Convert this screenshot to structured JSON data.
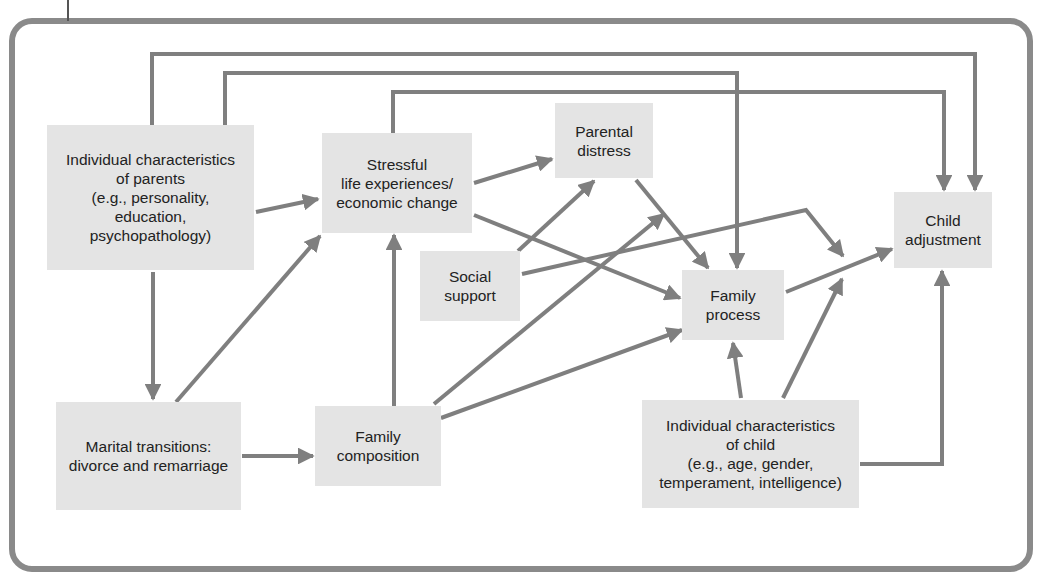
{
  "diagram": {
    "colors": {
      "frame": "#8a8a8a",
      "edge": "#7f7f7f",
      "node_fill": "#e4e4e4",
      "text": "#222222",
      "background": "#ffffff"
    },
    "nodes": [
      {
        "id": "parents",
        "label": "Individual characteristics\nof parents\n(e.g., personality,\neducation,\npsychopathology)",
        "x": 47,
        "y": 125,
        "w": 207,
        "h": 145
      },
      {
        "id": "stressful",
        "label": "Stressful\nlife experiences/\neconomic change",
        "x": 322,
        "y": 133,
        "w": 150,
        "h": 100
      },
      {
        "id": "parental_distress",
        "label": "Parental\ndistress",
        "x": 555,
        "y": 103,
        "w": 98,
        "h": 75
      },
      {
        "id": "social_support",
        "label": "Social\nsupport",
        "x": 420,
        "y": 251,
        "w": 100,
        "h": 70
      },
      {
        "id": "family_process",
        "label": "Family\nprocess",
        "x": 682,
        "y": 270,
        "w": 102,
        "h": 70
      },
      {
        "id": "child_adjustment",
        "label": "Child\nadjustment",
        "x": 894,
        "y": 192,
        "w": 98,
        "h": 76
      },
      {
        "id": "marital",
        "label": "Marital transitions:\ndivorce and remarriage",
        "x": 56,
        "y": 402,
        "w": 185,
        "h": 108
      },
      {
        "id": "family_composition",
        "label": "Family\ncomposition",
        "x": 315,
        "y": 406,
        "w": 126,
        "h": 80
      },
      {
        "id": "child_chars",
        "label": "Individual characteristics\nof child\n(e.g., age, gender,\ntemperament, intelligence)",
        "x": 642,
        "y": 400,
        "w": 217,
        "h": 108
      }
    ],
    "edges": [
      {
        "from": "parents",
        "to": "child_adjustment",
        "points": [
          [
            152,
            125
          ],
          [
            152,
            54
          ],
          [
            975,
            54
          ],
          [
            975,
            190
          ]
        ],
        "arrow": true
      },
      {
        "from": "parents",
        "to": "family_process",
        "points": [
          [
            225,
            125
          ],
          [
            225,
            73
          ],
          [
            737,
            73
          ],
          [
            737,
            268
          ]
        ],
        "arrow": true
      },
      {
        "from": "stressful",
        "to": "child_adjustment",
        "points": [
          [
            393,
            133
          ],
          [
            393,
            92
          ],
          [
            944,
            92
          ],
          [
            944,
            190
          ]
        ],
        "arrow": true
      },
      {
        "from": "parents",
        "to": "stressful",
        "points": [
          [
            256,
            212
          ],
          [
            318,
            199
          ]
        ],
        "arrow": true
      },
      {
        "from": "parents",
        "to": "marital",
        "points": [
          [
            153,
            272
          ],
          [
            153,
            399
          ]
        ],
        "arrow": true
      },
      {
        "from": "marital",
        "to": "stressful",
        "points": [
          [
            176,
            402
          ],
          [
            320,
            236
          ]
        ],
        "arrow": true
      },
      {
        "from": "marital",
        "to": "family_composition",
        "points": [
          [
            242,
            456
          ],
          [
            313,
            456
          ]
        ],
        "arrow": true
      },
      {
        "from": "family_composition",
        "to": "stressful",
        "points": [
          [
            394,
            406
          ],
          [
            394,
            235
          ]
        ],
        "arrow": true
      },
      {
        "from": "stressful",
        "to": "parental_distress",
        "points": [
          [
            474,
            183
          ],
          [
            552,
            159
          ]
        ],
        "arrow": true
      },
      {
        "from": "stressful",
        "to": "family_process",
        "points": [
          [
            474,
            215
          ],
          [
            680,
            298
          ]
        ],
        "arrow": true
      },
      {
        "from": "social_support",
        "to": "parental_distress",
        "points": [
          [
            518,
            251
          ],
          [
            594,
            181
          ]
        ],
        "arrow": true
      },
      {
        "from": "social_support",
        "to": "child_adjustment_path",
        "points": [
          [
            522,
            274
          ],
          [
            806,
            210
          ],
          [
            843,
            256
          ]
        ],
        "arrow": true
      },
      {
        "from": "parental_distress",
        "to": "family_process",
        "points": [
          [
            636,
            180
          ],
          [
            708,
            268
          ]
        ],
        "arrow": true
      },
      {
        "from": "family_composition",
        "to": "parental_distress_path",
        "points": [
          [
            434,
            404
          ],
          [
            664,
            214
          ]
        ],
        "arrow": true
      },
      {
        "from": "family_composition",
        "to": "family_process",
        "points": [
          [
            441,
            418
          ],
          [
            682,
            330
          ]
        ],
        "arrow": true
      },
      {
        "from": "family_process",
        "to": "child_adjustment",
        "points": [
          [
            786,
            292
          ],
          [
            892,
            249
          ]
        ],
        "arrow": true
      },
      {
        "from": "child_chars",
        "to": "family_process",
        "points": [
          [
            741,
            398
          ],
          [
            733,
            343
          ]
        ],
        "arrow": true
      },
      {
        "from": "child_chars",
        "to": "child_adjustment_path",
        "points": [
          [
            783,
            398
          ],
          [
            842,
            279
          ]
        ],
        "arrow": true
      },
      {
        "from": "child_chars",
        "to": "child_adjustment",
        "points": [
          [
            860,
            464
          ],
          [
            942,
            464
          ],
          [
            942,
            271
          ]
        ],
        "arrow": true
      }
    ],
    "frame": {
      "x": 12,
      "y": 21,
      "w": 1018,
      "h": 548,
      "radius": 20,
      "stroke": 6
    },
    "tick": {
      "x": 68,
      "y1": 0,
      "y2": 21
    }
  }
}
